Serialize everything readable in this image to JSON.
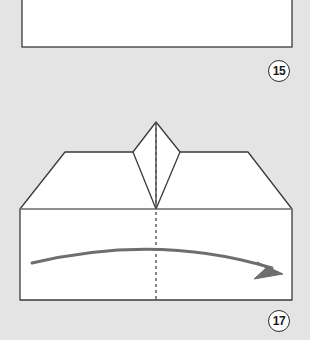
{
  "page": {
    "background_color": "#e4e4e4",
    "width": 310,
    "height": 340,
    "kind": "origami-instruction-diagram"
  },
  "steps": [
    {
      "number": "15",
      "badge_name": "step-number-15",
      "panel_name": "step-15-panel",
      "description": "partial rectangular paper panel at top",
      "panel": {
        "x": 22,
        "y": -10,
        "width": 270,
        "height": 57,
        "fill": "#ffffff",
        "stroke": "#3a3a3a"
      }
    },
    {
      "number": "17",
      "badge_name": "step-number-17",
      "panel_name": "step-17-panel",
      "description": "symmetric folded form with center kite peak, two wings, body rectangle, center fold line and curved fold arrow"
    }
  ],
  "figure": {
    "name": "origami-form-step-17",
    "fill": "#ffffff",
    "stroke": "#3a3a3a",
    "stroke_width": 1.3,
    "outline_points": "20,300 20,209 65,152 133,152 156,122 180,152 248,152 292,209 292,300",
    "body_top_y": 209,
    "body_bottom_y": 300,
    "left_x": 20,
    "right_x": 292,
    "apex": {
      "x": 156,
      "y": 122
    },
    "center_x": 156,
    "shoulder_y": 152,
    "kite": {
      "name": "center-kite-peak",
      "points": "156,122 180,152 156,209 133,152",
      "left_vertex_x": 133,
      "right_vertex_x": 180,
      "bottom_y": 209
    },
    "wings": [
      {
        "name": "left-wing",
        "points": "20,209 65,152 133,152 156,209"
      },
      {
        "name": "right-wing",
        "points": "292,209 248,152 180,152 156,209"
      }
    ],
    "creases": [
      {
        "name": "crease-left-kite",
        "x1": 133,
        "y1": 152,
        "x2": 156,
        "y2": 209
      },
      {
        "name": "crease-right-kite",
        "x1": 180,
        "y1": 152,
        "x2": 156,
        "y2": 209
      },
      {
        "name": "crease-kite-center-vertical",
        "x1": 156,
        "y1": 122,
        "x2": 156,
        "y2": 209
      },
      {
        "name": "crease-body-top",
        "x1": 20,
        "y1": 209,
        "x2": 292,
        "y2": 209
      }
    ]
  },
  "fold_line": {
    "name": "center-fold-dashed-line",
    "x": 156,
    "y_start": 122,
    "y_end": 300,
    "color": "#555555",
    "dash": "3 3",
    "style": "dashed-valley-fold"
  },
  "arrow": {
    "name": "fold-direction-arrow",
    "color": "#6e6e6e",
    "stroke_width": 3,
    "path": "M 32,263 Q 158,233 272,268",
    "head_points": "283,274 257,262 266,268 254,279",
    "direction": "left-to-right-curved-downward"
  }
}
